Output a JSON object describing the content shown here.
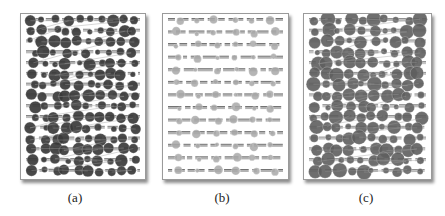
{
  "figure": {
    "panels": [
      {
        "id": "a",
        "caption": "(a)",
        "description": "Devanagari text page with dark gray fixation circles overlaid",
        "page_box": {
          "x": 20,
          "y": 13,
          "w": 124,
          "h": 165
        },
        "caption_pos": {
          "x": 55,
          "y": 190
        },
        "circle_color": "#3a3a3a",
        "circle_opacity": 0.92,
        "text_color": "#6a6a6a",
        "line_count": 15,
        "seed": 11,
        "circles_per_line": 10,
        "radius_range": [
          2.5,
          6.5
        ],
        "saccade_lines": true
      },
      {
        "id": "b",
        "caption": "(b)",
        "description": "Devanagari text page with light gray fixation circles overlaid",
        "page_box": {
          "x": 162,
          "y": 13,
          "w": 125,
          "h": 165
        },
        "caption_pos": {
          "x": 202,
          "y": 190
        },
        "circle_color": "#a8a8a8",
        "circle_opacity": 0.85,
        "text_color": "#555555",
        "line_count": 13,
        "seed": 23,
        "circles_per_line": 6,
        "radius_range": [
          2.0,
          4.5
        ],
        "saccade_lines": false
      },
      {
        "id": "c",
        "caption": "(c)",
        "description": "Devanagari text page with medium gray fixation circles overlaid",
        "page_box": {
          "x": 303,
          "y": 13,
          "w": 127,
          "h": 165
        },
        "caption_pos": {
          "x": 346,
          "y": 190
        },
        "circle_color": "#5e5e5e",
        "circle_opacity": 0.9,
        "text_color": "#7a7a7a",
        "line_count": 15,
        "seed": 37,
        "circles_per_line": 10,
        "radius_range": [
          2.5,
          7.5
        ],
        "saccade_lines": true
      }
    ]
  }
}
